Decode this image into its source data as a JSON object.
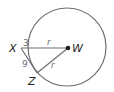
{
  "diagram": {
    "type": "geometry-circle-tangent",
    "points": {
      "X": "X",
      "W": "W",
      "Z": "Z"
    },
    "labels": {
      "radius_top": "r",
      "radius_bottom": "r",
      "segment_outside": "3",
      "tangent_segment": "9"
    },
    "colors": {
      "stroke": "#6d6e71",
      "text": "#231f20"
    }
  }
}
